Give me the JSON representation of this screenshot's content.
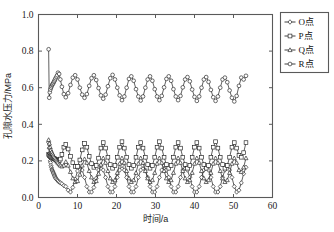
{
  "chart_data": {
    "type": "line",
    "title": "",
    "xlabel": "时间/a",
    "ylabel": "孔隙水压力/MPa",
    "xlim": [
      0,
      60
    ],
    "ylim": [
      0.0,
      1.0
    ],
    "xticks": [
      0,
      10,
      20,
      30,
      40,
      50,
      60
    ],
    "xticklabels": [
      "0",
      "10",
      "20",
      "30",
      "40",
      "50",
      "60"
    ],
    "yticks": [
      0.0,
      0.2,
      0.4,
      0.6,
      0.8,
      1.0
    ],
    "yticklabels": [
      "0.0",
      "0.2",
      "0.4",
      "0.6",
      "0.8",
      "1.0"
    ],
    "grid": false,
    "legend_position": "outside-top-right",
    "legend_entries": [
      "O点",
      "P点",
      "Q点",
      "R点"
    ],
    "series": [
      {
        "name": "O点",
        "marker": "diamond",
        "x": [
          2.6,
          2.7,
          2.8,
          2.9,
          3.0,
          3.1,
          3.2,
          3.3,
          3.4,
          3.5,
          3.6,
          3.7,
          3.8,
          3.9,
          4.0,
          4.1,
          4.2,
          4.3,
          4.4,
          4.6,
          4.8,
          5.0,
          5.3,
          5.6,
          6.0,
          6.5,
          7.0,
          7.6,
          8.2,
          8.8,
          9.4,
          10.0,
          10.6,
          11.2,
          11.8,
          12.4,
          13.0,
          13.6,
          14.2,
          14.8,
          15.4,
          16.0,
          16.6,
          17.2,
          17.8,
          18.4,
          19.0,
          19.6,
          20.2,
          20.8,
          21.4,
          22.0,
          22.6,
          23.2,
          23.8,
          24.4,
          25.0,
          25.6,
          26.2,
          26.8,
          27.4,
          28.0,
          28.6,
          29.2,
          29.8,
          30.4,
          31.0,
          31.6,
          32.2,
          32.8,
          33.4,
          34.0,
          34.6,
          35.2,
          35.8,
          36.4,
          37.0,
          37.6,
          38.2,
          38.8,
          39.4,
          40.0,
          40.6,
          41.2,
          41.8,
          42.4,
          43.0,
          43.6,
          44.2,
          44.8,
          45.4,
          46.0,
          46.6,
          47.2,
          47.8,
          48.4,
          49.0,
          49.6,
          50.2,
          50.8,
          51.4,
          52.0,
          52.6,
          53.2
        ],
        "y": [
          0.3,
          0.27,
          0.24,
          0.22,
          0.2,
          0.19,
          0.175,
          0.165,
          0.155,
          0.15,
          0.145,
          0.14,
          0.135,
          0.13,
          0.125,
          0.12,
          0.115,
          0.11,
          0.105,
          0.1,
          0.095,
          0.09,
          0.085,
          0.08,
          0.075,
          0.065,
          0.06,
          0.04,
          0.03,
          0.055,
          0.1,
          0.145,
          0.17,
          0.15,
          0.11,
          0.06,
          0.03,
          0.03,
          0.055,
          0.105,
          0.15,
          0.175,
          0.15,
          0.11,
          0.06,
          0.03,
          0.03,
          0.06,
          0.11,
          0.15,
          0.175,
          0.15,
          0.11,
          0.06,
          0.03,
          0.03,
          0.06,
          0.11,
          0.15,
          0.175,
          0.15,
          0.11,
          0.06,
          0.03,
          0.03,
          0.06,
          0.11,
          0.15,
          0.175,
          0.15,
          0.11,
          0.06,
          0.03,
          0.03,
          0.06,
          0.11,
          0.15,
          0.175,
          0.15,
          0.11,
          0.06,
          0.03,
          0.03,
          0.06,
          0.11,
          0.15,
          0.175,
          0.15,
          0.11,
          0.06,
          0.03,
          0.03,
          0.06,
          0.11,
          0.15,
          0.175,
          0.15,
          0.11,
          0.06,
          0.03,
          0.04,
          0.08,
          0.13,
          0.165
        ]
      },
      {
        "name": "P点",
        "marker": "square",
        "x": [
          2.6,
          2.8,
          3.0,
          3.2,
          3.4,
          3.6,
          3.8,
          4.0,
          4.2,
          4.4,
          4.6,
          4.8,
          5.0,
          5.3,
          5.6,
          6.0,
          6.5,
          7.0,
          7.6,
          8.2,
          8.8,
          9.4,
          10.0,
          10.6,
          11.2,
          11.8,
          12.4,
          13.0,
          13.6,
          14.2,
          14.8,
          15.4,
          16.0,
          16.6,
          17.2,
          17.8,
          18.4,
          19.0,
          19.6,
          20.2,
          20.8,
          21.4,
          22.0,
          22.6,
          23.2,
          23.8,
          24.4,
          25.0,
          25.6,
          26.2,
          26.8,
          27.4,
          28.0,
          28.6,
          29.2,
          29.8,
          30.4,
          31.0,
          31.6,
          32.2,
          32.8,
          33.4,
          34.0,
          34.6,
          35.2,
          35.8,
          36.4,
          37.0,
          37.6,
          38.2,
          38.8,
          39.4,
          40.0,
          40.6,
          41.2,
          41.8,
          42.4,
          43.0,
          43.6,
          44.2,
          44.8,
          45.4,
          46.0,
          46.6,
          47.2,
          47.8,
          48.4,
          49.0,
          49.6,
          50.2,
          50.8,
          51.4,
          52.0,
          52.6,
          53.2
        ],
        "y": [
          0.235,
          0.23,
          0.225,
          0.222,
          0.22,
          0.218,
          0.215,
          0.213,
          0.21,
          0.208,
          0.205,
          0.203,
          0.2,
          0.2,
          0.21,
          0.235,
          0.275,
          0.29,
          0.265,
          0.225,
          0.19,
          0.17,
          0.17,
          0.205,
          0.26,
          0.295,
          0.275,
          0.225,
          0.185,
          0.165,
          0.175,
          0.215,
          0.27,
          0.3,
          0.27,
          0.22,
          0.18,
          0.16,
          0.175,
          0.22,
          0.275,
          0.305,
          0.27,
          0.22,
          0.18,
          0.16,
          0.175,
          0.22,
          0.275,
          0.3,
          0.27,
          0.22,
          0.18,
          0.16,
          0.175,
          0.22,
          0.275,
          0.305,
          0.27,
          0.22,
          0.18,
          0.16,
          0.175,
          0.22,
          0.275,
          0.3,
          0.27,
          0.22,
          0.18,
          0.16,
          0.175,
          0.22,
          0.275,
          0.3,
          0.27,
          0.22,
          0.18,
          0.16,
          0.175,
          0.22,
          0.275,
          0.305,
          0.27,
          0.22,
          0.18,
          0.16,
          0.175,
          0.22,
          0.275,
          0.3,
          0.27,
          0.23,
          0.22,
          0.245,
          0.3
        ]
      },
      {
        "name": "Q点",
        "marker": "triangle",
        "x": [
          2.6,
          2.8,
          3.0,
          3.2,
          3.4,
          3.6,
          3.8,
          4.0,
          4.2,
          4.4,
          4.6,
          4.8,
          5.0,
          5.3,
          5.6,
          6.0,
          6.5,
          7.0,
          7.6,
          8.2,
          8.8,
          9.4,
          10.0,
          10.6,
          11.2,
          11.8,
          12.4,
          13.0,
          13.6,
          14.2,
          14.8,
          15.4,
          16.0,
          16.6,
          17.2,
          17.8,
          18.4,
          19.0,
          19.6,
          20.2,
          20.8,
          21.4,
          22.0,
          22.6,
          23.2,
          23.8,
          24.4,
          25.0,
          25.6,
          26.2,
          26.8,
          27.4,
          28.0,
          28.6,
          29.2,
          29.8,
          30.4,
          31.0,
          31.6,
          32.2,
          32.8,
          33.4,
          34.0,
          34.6,
          35.2,
          35.8,
          36.4,
          37.0,
          37.6,
          38.2,
          38.8,
          39.4,
          40.0,
          40.6,
          41.2,
          41.8,
          42.4,
          43.0,
          43.6,
          44.2,
          44.8,
          45.4,
          46.0,
          46.6,
          47.2,
          47.8,
          48.4,
          49.0,
          49.6,
          50.2,
          50.8,
          51.4,
          52.0,
          52.6,
          53.2
        ],
        "y": [
          0.315,
          0.295,
          0.275,
          0.26,
          0.248,
          0.238,
          0.23,
          0.222,
          0.215,
          0.208,
          0.202,
          0.196,
          0.19,
          0.182,
          0.175,
          0.17,
          0.175,
          0.195,
          0.175,
          0.14,
          0.105,
          0.085,
          0.09,
          0.125,
          0.175,
          0.21,
          0.19,
          0.145,
          0.11,
          0.085,
          0.09,
          0.13,
          0.18,
          0.215,
          0.19,
          0.145,
          0.105,
          0.085,
          0.095,
          0.135,
          0.185,
          0.215,
          0.19,
          0.145,
          0.105,
          0.085,
          0.095,
          0.135,
          0.185,
          0.215,
          0.19,
          0.145,
          0.105,
          0.085,
          0.095,
          0.135,
          0.185,
          0.215,
          0.19,
          0.145,
          0.105,
          0.085,
          0.095,
          0.135,
          0.185,
          0.215,
          0.19,
          0.145,
          0.105,
          0.085,
          0.095,
          0.135,
          0.185,
          0.215,
          0.19,
          0.145,
          0.105,
          0.085,
          0.095,
          0.135,
          0.185,
          0.215,
          0.19,
          0.145,
          0.105,
          0.085,
          0.095,
          0.135,
          0.185,
          0.215,
          0.19,
          0.15,
          0.14,
          0.165,
          0.215
        ]
      },
      {
        "name": "R点",
        "marker": "circle",
        "x": [
          2.6,
          2.75,
          2.9,
          3.05,
          3.2,
          3.35,
          3.5,
          3.65,
          3.8,
          3.95,
          4.1,
          4.25,
          4.4,
          4.6,
          4.8,
          5.0,
          5.3,
          5.6,
          6.0,
          6.5,
          7.0,
          7.6,
          8.2,
          8.8,
          9.4,
          10.0,
          10.6,
          11.2,
          11.8,
          12.4,
          13.0,
          13.6,
          14.2,
          14.8,
          15.4,
          16.0,
          16.6,
          17.2,
          17.8,
          18.4,
          19.0,
          19.6,
          20.2,
          20.8,
          21.4,
          22.0,
          22.6,
          23.2,
          23.8,
          24.4,
          25.0,
          25.6,
          26.2,
          26.8,
          27.4,
          28.0,
          28.6,
          29.2,
          29.8,
          30.4,
          31.0,
          31.6,
          32.2,
          32.8,
          33.4,
          34.0,
          34.6,
          35.2,
          35.8,
          36.4,
          37.0,
          37.6,
          38.2,
          38.8,
          39.4,
          40.0,
          40.6,
          41.2,
          41.8,
          42.4,
          43.0,
          43.6,
          44.2,
          44.8,
          45.4,
          46.0,
          46.6,
          47.2,
          47.8,
          48.4,
          49.0,
          49.6,
          50.2,
          50.8,
          51.4,
          52.0,
          52.6,
          53.2
        ],
        "y": [
          0.81,
          0.545,
          0.575,
          0.59,
          0.6,
          0.608,
          0.615,
          0.62,
          0.625,
          0.632,
          0.638,
          0.645,
          0.652,
          0.66,
          0.668,
          0.682,
          0.675,
          0.645,
          0.605,
          0.565,
          0.548,
          0.57,
          0.615,
          0.655,
          0.668,
          0.645,
          0.6,
          0.562,
          0.545,
          0.565,
          0.61,
          0.652,
          0.668,
          0.642,
          0.598,
          0.558,
          0.54,
          0.562,
          0.608,
          0.652,
          0.67,
          0.645,
          0.6,
          0.558,
          0.532,
          0.552,
          0.6,
          0.648,
          0.662,
          0.638,
          0.592,
          0.552,
          0.53,
          0.552,
          0.6,
          0.645,
          0.662,
          0.638,
          0.592,
          0.552,
          0.532,
          0.555,
          0.602,
          0.648,
          0.662,
          0.638,
          0.592,
          0.552,
          0.532,
          0.555,
          0.602,
          0.645,
          0.658,
          0.635,
          0.59,
          0.55,
          0.528,
          0.552,
          0.6,
          0.645,
          0.658,
          0.632,
          0.588,
          0.548,
          0.528,
          0.552,
          0.6,
          0.645,
          0.655,
          0.63,
          0.585,
          0.545,
          0.525,
          0.555,
          0.61,
          0.655,
          0.645,
          0.665
        ]
      }
    ]
  }
}
